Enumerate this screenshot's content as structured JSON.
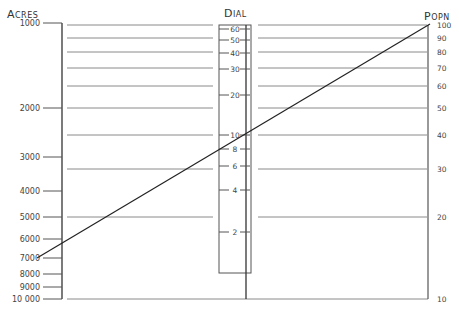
{
  "diagram": {
    "type": "nomogram",
    "colors": {
      "ink": "#222222",
      "rule": "#8a8a8a",
      "text": "#444444",
      "background": "#ffffff"
    },
    "axes": {
      "acres": {
        "title": "Acres",
        "ticks": [
          {
            "label": "1000",
            "y": 23
          },
          {
            "label": "2000",
            "y": 108
          },
          {
            "label": "3000",
            "y": 157
          },
          {
            "label": "4000",
            "y": 191
          },
          {
            "label": "5000",
            "y": 217
          },
          {
            "label": "6000",
            "y": 239
          },
          {
            "label": "7000",
            "y": 258
          },
          {
            "label": "8000",
            "y": 274
          },
          {
            "label": "9000",
            "y": 287
          },
          {
            "label": "10 000",
            "y": 299
          }
        ]
      },
      "dial": {
        "title": "Dial",
        "ticks": [
          {
            "label": "60",
            "y": 29
          },
          {
            "label": "50",
            "y": 40
          },
          {
            "label": "40",
            "y": 53
          },
          {
            "label": "30",
            "y": 69
          },
          {
            "label": "20",
            "y": 95
          },
          {
            "label": "10",
            "y": 135
          },
          {
            "label": "8",
            "y": 149
          },
          {
            "label": "6",
            "y": 166
          },
          {
            "label": "4",
            "y": 190
          },
          {
            "label": "2",
            "y": 232
          }
        ]
      },
      "popn": {
        "title": "Popn",
        "ticks": [
          {
            "label": "100",
            "y": 25
          },
          {
            "label": "90",
            "y": 38
          },
          {
            "label": "80",
            "y": 52
          },
          {
            "label": "70",
            "y": 68
          },
          {
            "label": "60",
            "y": 86
          },
          {
            "label": "50",
            "y": 108
          },
          {
            "label": "40",
            "y": 135
          },
          {
            "label": "30",
            "y": 169
          },
          {
            "label": "20",
            "y": 217
          },
          {
            "label": "10",
            "y": 299
          }
        ]
      }
    },
    "isopleth": {
      "from": {
        "axis": "acres",
        "value": "7000"
      },
      "through": {
        "axis": "dial",
        "value": "10"
      },
      "to": {
        "axis": "popn",
        "value": "100"
      }
    }
  }
}
